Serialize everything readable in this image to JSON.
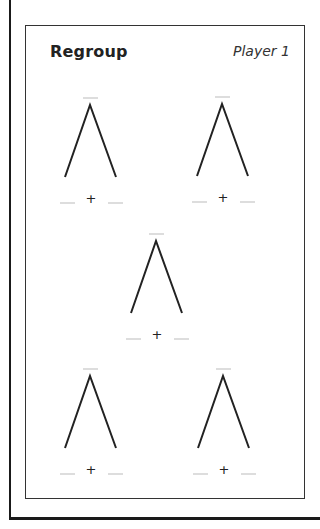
{
  "worksheet": {
    "title": "Regroup",
    "player_label": "Player 1",
    "operator": "+",
    "colors": {
      "frame": "#1a1a1a",
      "tree_lines": "#222222",
      "blank_lines": "#bbbbbb"
    },
    "trees": [
      {
        "position": "top-left",
        "whole": "",
        "part_a": "",
        "part_b": ""
      },
      {
        "position": "top-right",
        "whole": "",
        "part_a": "",
        "part_b": ""
      },
      {
        "position": "middle",
        "whole": "",
        "part_a": "",
        "part_b": ""
      },
      {
        "position": "bottom-left",
        "whole": "",
        "part_a": "",
        "part_b": ""
      },
      {
        "position": "bottom-right",
        "whole": "",
        "part_a": "",
        "part_b": ""
      }
    ]
  }
}
